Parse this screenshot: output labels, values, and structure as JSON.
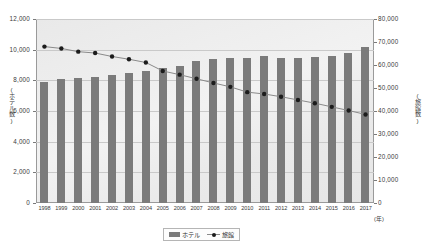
{
  "chart_data": {
    "type": "bar",
    "title": "",
    "xlabel": "(年)",
    "ylabel": "(ホテル数)",
    "ylabel_right": "(旅館数)",
    "categories": [
      "1998",
      "1999",
      "2000",
      "2001",
      "2002",
      "2003",
      "2004",
      "2005",
      "2006",
      "2007",
      "2008",
      "2009",
      "2010",
      "2011",
      "2012",
      "2013",
      "2014",
      "2015",
      "2016",
      "2017"
    ],
    "ylim": [
      0,
      12000
    ],
    "ylim_right": [
      0,
      80000
    ],
    "yticks": [
      "0",
      "2,000",
      "4,000",
      "6,000",
      "8,000",
      "10,000",
      "12,000"
    ],
    "yticks_right": [
      "0",
      "10,000",
      "20,000",
      "30,000",
      "40,000",
      "50,000",
      "60,000",
      "70,000",
      "80,000"
    ],
    "grid": true,
    "legend_position": "bottom",
    "series": [
      {
        "name": "ホテル",
        "type": "bar",
        "axis": "left",
        "color": "#7b7b7b",
        "values": [
          7900,
          8070,
          8130,
          8220,
          8320,
          8450,
          8600,
          8800,
          8930,
          9250,
          9390,
          9450,
          9450,
          9600,
          9450,
          9460,
          9550,
          9600,
          9800,
          10200
        ]
      },
      {
        "name": "旅館",
        "type": "line",
        "axis": "right",
        "color": "#8a8a8a",
        "marker_color": "#1c1c1c",
        "values": [
          68000,
          67200,
          65800,
          65200,
          63700,
          62500,
          61100,
          57400,
          55800,
          54000,
          52200,
          50500,
          48200,
          47400,
          46200,
          44800,
          43400,
          41800,
          40200,
          38500
        ]
      }
    ],
    "legend": [
      "ホテル",
      "旅館"
    ]
  }
}
